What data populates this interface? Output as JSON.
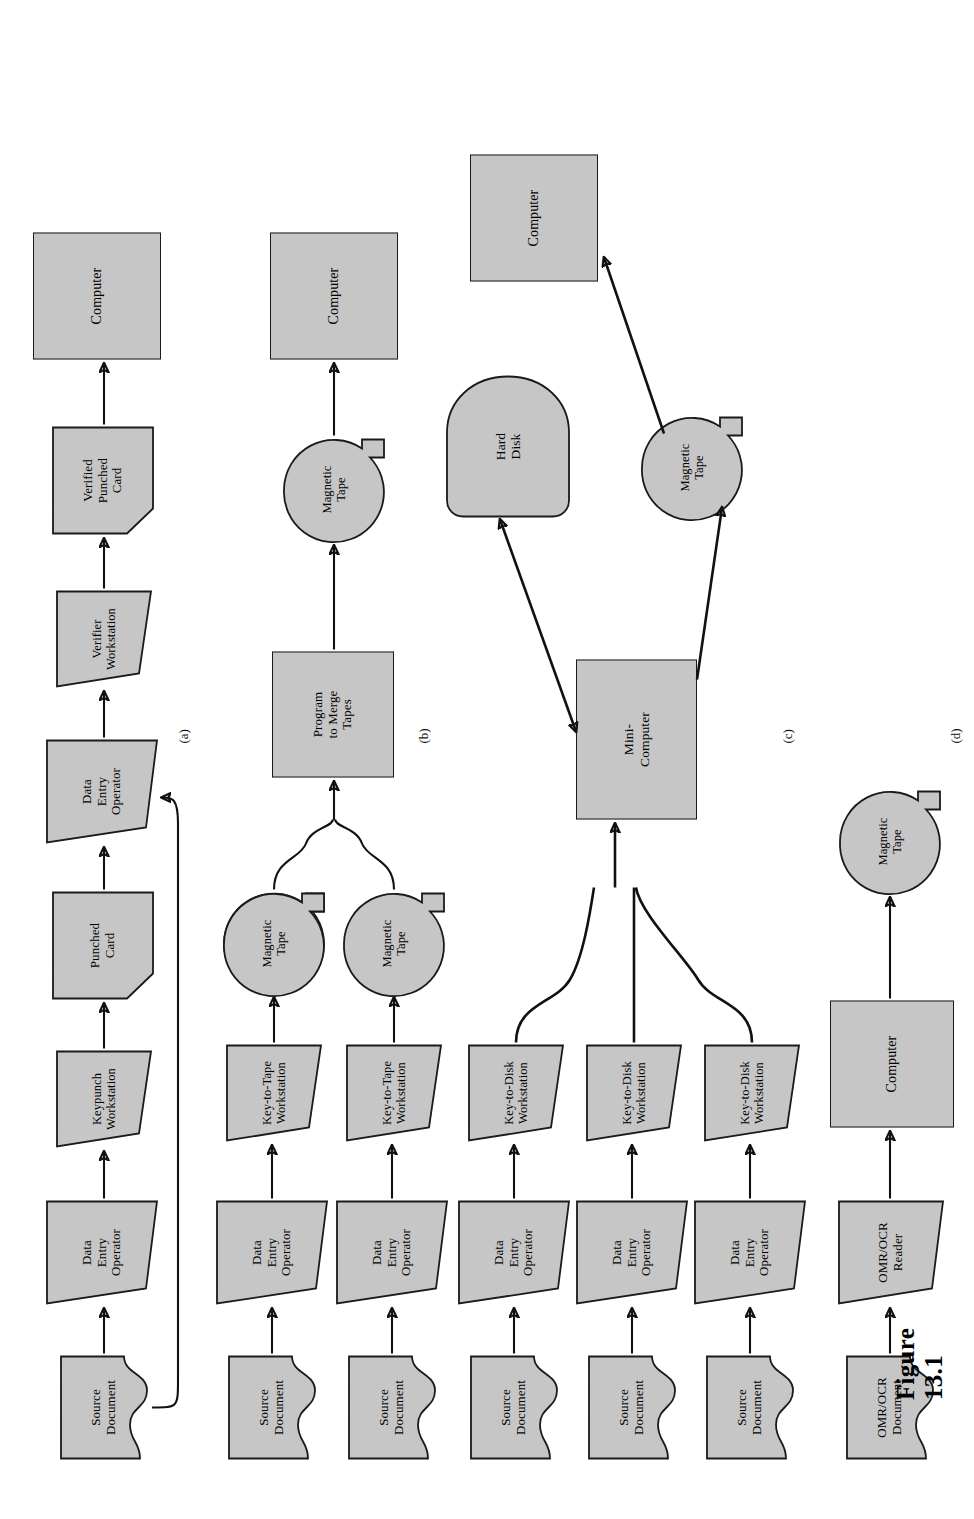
{
  "figure": {
    "caption": "Figure 13.1",
    "panel_labels": [
      "(a)",
      "(b)",
      "(c)",
      "(d)"
    ]
  },
  "palette": {
    "shape_fill": "#c6c6c6",
    "shape_stroke": "#1a1a1a",
    "background": "#ffffff",
    "text": "#000000"
  },
  "panels": [
    {
      "id": "a",
      "label": "(a)",
      "nodes": [
        {
          "id": "a_src",
          "shape": "document",
          "lines": [
            "Source",
            "Document"
          ]
        },
        {
          "id": "a_op",
          "shape": "trapezoid",
          "lines": [
            "Data",
            "Entry",
            "Operator"
          ]
        },
        {
          "id": "a_kp",
          "shape": "trapezoid",
          "lines": [
            "Keypunch",
            "Workstation"
          ]
        },
        {
          "id": "a_card",
          "shape": "punchedcard",
          "lines": [
            "Punched",
            "Card"
          ]
        },
        {
          "id": "a_op2",
          "shape": "trapezoid",
          "lines": [
            "Data",
            "Entry",
            "Operator"
          ]
        },
        {
          "id": "a_ver",
          "shape": "trapezoid",
          "lines": [
            "Verifier",
            "Workstation"
          ]
        },
        {
          "id": "a_vcard",
          "shape": "punchedcard",
          "lines": [
            "Verified",
            "Punched",
            "Card"
          ]
        },
        {
          "id": "a_comp",
          "shape": "rectangle",
          "lines": [
            "Computer"
          ]
        }
      ]
    },
    {
      "id": "b",
      "label": "(b)",
      "nodes": [
        {
          "id": "b_src1",
          "shape": "document",
          "lines": [
            "Source",
            "Document"
          ]
        },
        {
          "id": "b_op1",
          "shape": "trapezoid",
          "lines": [
            "Data",
            "Entry",
            "Operator"
          ]
        },
        {
          "id": "b_kt1",
          "shape": "trapezoid",
          "lines": [
            "Key-to-Tape",
            "Workstation"
          ]
        },
        {
          "id": "b_tape1",
          "shape": "tape",
          "lines": [
            "Magnetic",
            "Tape"
          ]
        },
        {
          "id": "b_src2",
          "shape": "document",
          "lines": [
            "Source",
            "Document"
          ]
        },
        {
          "id": "b_op2",
          "shape": "trapezoid",
          "lines": [
            "Data",
            "Entry",
            "Operator"
          ]
        },
        {
          "id": "b_kt2",
          "shape": "trapezoid",
          "lines": [
            "Key-to-Tape",
            "Workstation"
          ]
        },
        {
          "id": "b_tape2",
          "shape": "tape",
          "lines": [
            "Magnetic",
            "Tape"
          ]
        },
        {
          "id": "b_prog",
          "shape": "rectangle",
          "lines": [
            "Program",
            "to Merge",
            "Tapes"
          ]
        },
        {
          "id": "b_tape3",
          "shape": "tape",
          "lines": [
            "Magnetic",
            "Tape"
          ]
        },
        {
          "id": "b_comp",
          "shape": "rectangle",
          "lines": [
            "Computer"
          ]
        }
      ]
    },
    {
      "id": "c",
      "label": "(c)",
      "nodes": [
        {
          "id": "c_src1",
          "shape": "document",
          "lines": [
            "Source",
            "Document"
          ]
        },
        {
          "id": "c_op1",
          "shape": "trapezoid",
          "lines": [
            "Data",
            "Entry",
            "Operator"
          ]
        },
        {
          "id": "c_kd1",
          "shape": "trapezoid",
          "lines": [
            "Key-to-Disk",
            "Workstation"
          ]
        },
        {
          "id": "c_src2",
          "shape": "document",
          "lines": [
            "Source",
            "Document"
          ]
        },
        {
          "id": "c_op2",
          "shape": "trapezoid",
          "lines": [
            "Data",
            "Entry",
            "Operator"
          ]
        },
        {
          "id": "c_kd2",
          "shape": "trapezoid",
          "lines": [
            "Key-to-Disk",
            "Workstation"
          ]
        },
        {
          "id": "c_src3",
          "shape": "document",
          "lines": [
            "Source",
            "Document"
          ]
        },
        {
          "id": "c_op3",
          "shape": "trapezoid",
          "lines": [
            "Data",
            "Entry",
            "Operator"
          ]
        },
        {
          "id": "c_kd3",
          "shape": "trapezoid",
          "lines": [
            "Key-to-Disk",
            "Workstation"
          ]
        },
        {
          "id": "c_mini",
          "shape": "rectangle",
          "lines": [
            "Mini-",
            "Computer"
          ]
        },
        {
          "id": "c_disk",
          "shape": "harddisk",
          "lines": [
            "Hard",
            "Disk"
          ]
        },
        {
          "id": "c_tape",
          "shape": "tape",
          "lines": [
            "Magnetic",
            "Tape"
          ]
        },
        {
          "id": "c_comp",
          "shape": "rectangle",
          "lines": [
            "Computer"
          ]
        }
      ]
    },
    {
      "id": "d",
      "label": "(d)",
      "nodes": [
        {
          "id": "d_doc",
          "shape": "document",
          "lines": [
            "OMR/OCR",
            "Document"
          ]
        },
        {
          "id": "d_rdr",
          "shape": "trapezoid",
          "lines": [
            "OMR/OCR",
            "Reader"
          ]
        },
        {
          "id": "d_comp",
          "shape": "rectangle",
          "lines": [
            "Computer"
          ]
        },
        {
          "id": "d_tape",
          "shape": "tape",
          "lines": [
            "Magnetic",
            "Tape"
          ]
        }
      ]
    }
  ]
}
